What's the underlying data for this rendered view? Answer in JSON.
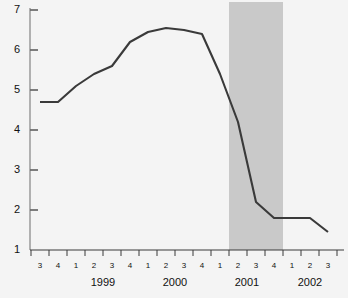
{
  "chart_data": {
    "type": "line",
    "title": "",
    "xlabel": "",
    "ylabel": "Percent",
    "ylim": [
      1,
      7
    ],
    "yticks": [
      1,
      2,
      3,
      4,
      5,
      6,
      7
    ],
    "ytick_labels": [
      "1",
      "2",
      "3",
      "4",
      "5",
      "6",
      "7"
    ],
    "grid": false,
    "legend": "none",
    "x": [
      "1998 Q3",
      "1998 Q4",
      "1999 Q1",
      "1999 Q2",
      "1999 Q3",
      "1999 Q4",
      "2000 Q1",
      "2000 Q2",
      "2000 Q3",
      "2000 Q4",
      "2001 Q1",
      "2001 Q2",
      "2001 Q3",
      "2001 Q4",
      "2002 Q1",
      "2002 Q2",
      "2002 Q3"
    ],
    "quarter_labels": [
      "3",
      "4",
      "1",
      "2",
      "3",
      "4",
      "1",
      "2",
      "3",
      "4",
      "1",
      "2",
      "3",
      "4",
      "1",
      "2",
      "3"
    ],
    "year_labels": [
      "1999",
      "2000",
      "2001",
      "2002"
    ],
    "values": [
      4.7,
      4.7,
      5.1,
      5.4,
      5.6,
      6.2,
      6.45,
      6.55,
      6.5,
      6.4,
      5.4,
      4.2,
      2.2,
      1.8,
      1.8,
      1.8,
      1.45
    ],
    "series": [
      {
        "name": "Percent",
        "color": "#3a3a3a",
        "values": [
          4.7,
          4.7,
          5.1,
          5.4,
          5.6,
          6.2,
          6.45,
          6.55,
          6.5,
          6.4,
          5.4,
          4.2,
          2.2,
          1.8,
          1.8,
          1.8,
          1.45
        ]
      }
    ],
    "shaded_region": {
      "label": "recession",
      "color": "#c9c9c9",
      "start": "2001 Q2",
      "end": "2001 Q4"
    },
    "axis_color": "#5a5a5a",
    "background_color": "#f4f4f4"
  }
}
